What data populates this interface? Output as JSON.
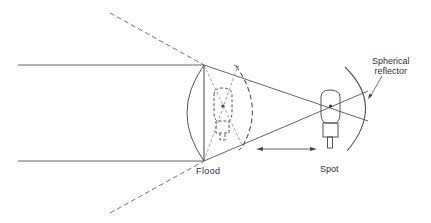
{
  "diagram": {
    "labels": {
      "flood": "Flood",
      "spot": "Spot",
      "reflector_line1": "Spherical",
      "reflector_line2": "reflector"
    },
    "colors": {
      "line": "#555555",
      "dashed": "#666666",
      "text": "#333333"
    },
    "components": [
      {
        "name": "plano-convex lens",
        "x": 204
      },
      {
        "name": "lamp (flood position)",
        "style": "dashed"
      },
      {
        "name": "lamp (spot position)",
        "style": "solid"
      },
      {
        "name": "spherical reflector"
      },
      {
        "name": "double-headed arrow",
        "meaning": "lamp travel between flood and spot"
      }
    ]
  }
}
